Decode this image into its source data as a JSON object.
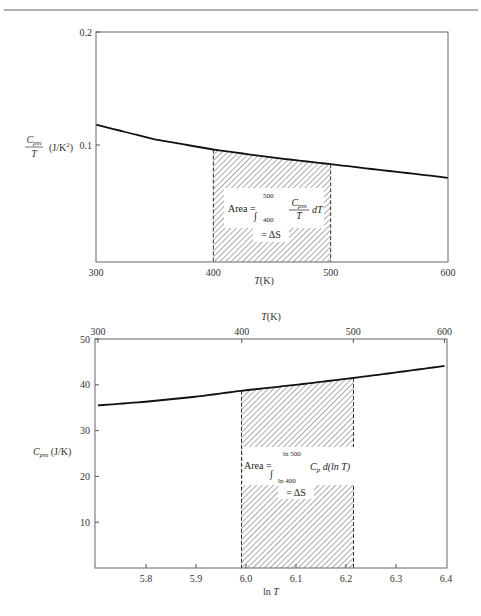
{
  "chart_data": [
    {
      "type": "area",
      "title": "",
      "xlabel": "T(K)",
      "ylabel": "Cpm/T (J/K²)",
      "ylabel_parts": {
        "frac_num": "C",
        "frac_num_sub": "pm",
        "frac_den": "T",
        "units": "(J/K",
        "units_sup": "2",
        "units_close": ")"
      },
      "xlim": [
        300,
        600
      ],
      "ylim": [
        0,
        0.2
      ],
      "grid": false,
      "x_ticks": [
        300,
        400,
        500,
        600
      ],
      "y_ticks": [
        0.1,
        0.2
      ],
      "y_tick_labels": [
        "0.1",
        "0.2"
      ],
      "series": [
        {
          "name": "Cpm/T",
          "x": [
            300,
            350,
            400,
            450,
            500,
            550,
            600
          ],
          "y": [
            0.118,
            0.105,
            0.096,
            0.089,
            0.083,
            0.077,
            0.071
          ]
        }
      ],
      "shaded_region": {
        "x_from": 400,
        "x_to": 500,
        "pattern": "diagonal-hatch",
        "border": "dashed"
      },
      "annotation": {
        "prefix": "Area = ",
        "integral_upper": "500",
        "integral_lower": "400",
        "integrand_num": "C",
        "integrand_num_sub": "pm",
        "integrand_den": "T",
        "differential": "dT",
        "result": "= ΔS"
      }
    },
    {
      "type": "area",
      "title": "",
      "xlabel": "ln T",
      "x2label": "T(K)",
      "ylabel": "Cpm (J/K)",
      "ylabel_parts": {
        "main": "C",
        "sub": "pm",
        "units": "(J/K)"
      },
      "xlim": [
        5.704,
        6.397
      ],
      "ylim": [
        0,
        50
      ],
      "grid": false,
      "x_ticks": [
        5.8,
        5.9,
        6.0,
        6.1,
        6.2,
        6.3,
        6.4
      ],
      "x_tick_labels": [
        "5.8",
        "5.9",
        "6.0",
        "6.1",
        "6.2",
        "6.3",
        "6.4"
      ],
      "x2_ticks": [
        300,
        400,
        500,
        600
      ],
      "y_ticks": [
        10,
        20,
        30,
        40,
        50
      ],
      "series": [
        {
          "name": "Cpm",
          "lnT": [
            5.704,
            5.8,
            5.9,
            5.991,
            6.1,
            6.215,
            6.3,
            6.397
          ],
          "y": [
            35.5,
            36.3,
            37.4,
            38.7,
            40.0,
            41.5,
            42.7,
            44.1
          ]
        }
      ],
      "shaded_region": {
        "x_from": 5.991,
        "x_to": 6.215,
        "pattern": "diagonal-hatch",
        "border": "dashed"
      },
      "annotation": {
        "prefix": "Area = ",
        "integral_upper": "ln 500",
        "integral_lower": "ln 400",
        "integrand": "C",
        "integrand_sub": "p",
        "differential": "d(ln T)",
        "result": "= ΔS"
      }
    }
  ],
  "colors": {
    "ink": "#222222",
    "axis": "#555555",
    "hatch": "#444444",
    "background": "#ffffff"
  }
}
